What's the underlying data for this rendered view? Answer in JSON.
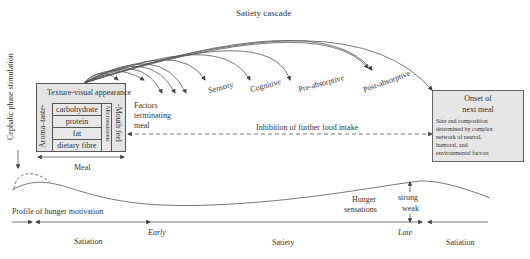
{
  "diagram": {
    "title": "Satiety cascade",
    "left_axis_label": "Cephalic phase stimulation",
    "meal_box": {
      "header": "Texture-visual appearance",
      "left_label": "Aroma–taste-",
      "right_label": "-Mouth feel",
      "micro_label": "Micronutrients",
      "nutrients": [
        "carbohydrate",
        "protein",
        "fat",
        "dietary fibre"
      ],
      "span_label": "Meal"
    },
    "factors_label": [
      "Factors",
      "terminating",
      "meal"
    ],
    "cascade_stages": [
      "Sensory",
      "Cognitive",
      "Pre-absorptive",
      "Post-absorptive"
    ],
    "inhibition_label": "Inhibition of further food intake",
    "onset_box": {
      "title_line1": "Onset of",
      "title_line2": "next meal",
      "body": [
        "Size and composition",
        "determined by complex",
        "network of neutral,",
        "humoral, and",
        "environmental factors"
      ]
    },
    "hunger_profile_label": "Profile of hunger motivation",
    "hunger_sensations_label": [
      "Hunger",
      "sensations"
    ],
    "strength_labels": {
      "top": "strong",
      "bottom": "weak"
    },
    "timeline": {
      "phases": [
        "Satiation",
        "Satiety",
        "Satiation"
      ],
      "markers": [
        "Early",
        "Late"
      ]
    }
  }
}
